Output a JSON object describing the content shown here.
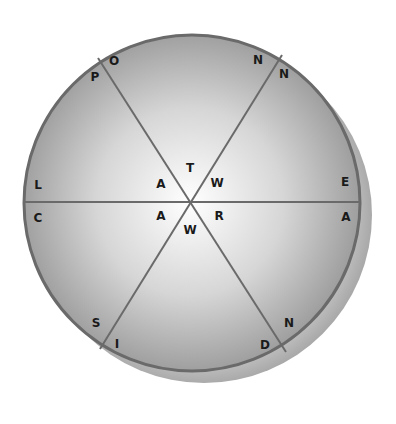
{
  "puzzle": {
    "title": "Word wheel puzzle",
    "center_letters": [
      {
        "id": "center-top",
        "char": "T",
        "x": 190,
        "y": 168
      },
      {
        "id": "center-upper-left",
        "char": "A",
        "x": 161,
        "y": 184
      },
      {
        "id": "center-upper-right",
        "char": "W",
        "x": 217,
        "y": 183
      },
      {
        "id": "center-lower-left",
        "char": "A",
        "x": 161,
        "y": 216
      },
      {
        "id": "center-lower-right",
        "char": "R",
        "x": 219,
        "y": 216
      },
      {
        "id": "center-bottom",
        "char": "W",
        "x": 190,
        "y": 230
      }
    ],
    "rim_letters": [
      {
        "id": "rim-o",
        "char": "O",
        "x": 114,
        "y": 61
      },
      {
        "id": "rim-p",
        "char": "P",
        "x": 95,
        "y": 77
      },
      {
        "id": "rim-n-top-left",
        "char": "N",
        "x": 258,
        "y": 60
      },
      {
        "id": "rim-n-top-right",
        "char": "N",
        "x": 284,
        "y": 74
      },
      {
        "id": "rim-l",
        "char": "L",
        "x": 38,
        "y": 185
      },
      {
        "id": "rim-e",
        "char": "E",
        "x": 345,
        "y": 182
      },
      {
        "id": "rim-c",
        "char": "C",
        "x": 38,
        "y": 218
      },
      {
        "id": "rim-a-right",
        "char": "A",
        "x": 346,
        "y": 217
      },
      {
        "id": "rim-s",
        "char": "S",
        "x": 96,
        "y": 323
      },
      {
        "id": "rim-i",
        "char": "I",
        "x": 117,
        "y": 344
      },
      {
        "id": "rim-n-bottom",
        "char": "N",
        "x": 289,
        "y": 323
      },
      {
        "id": "rim-d",
        "char": "D",
        "x": 265,
        "y": 345
      }
    ],
    "colors": {
      "rim": "#6a6a6a",
      "fill_center": "#ffffff",
      "fill_edge": "#9c9c9c",
      "shadow": "#b5b5b5",
      "text": "#1a1a1a"
    }
  }
}
